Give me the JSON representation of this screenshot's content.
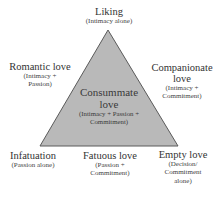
{
  "diagram": {
    "colors": {
      "triangle_fill": "#b9b9b9",
      "triangle_stroke": "#5a5a5a",
      "text": "#333333"
    },
    "apex": {
      "title": "Liking",
      "subtitle": "(Intimacy alone)"
    },
    "left_side": {
      "title": "Romantic love",
      "subtitle_line1": "(Intimacy +",
      "subtitle_line2": "Passion)"
    },
    "right_side": {
      "title_line1": "Companionate",
      "title_line2": "love",
      "subtitle_line1": "(Intimacy +",
      "subtitle_line2": "Commitment)"
    },
    "center": {
      "title_line1": "Consummate",
      "title_line2": "love",
      "subtitle_line1": "(Intimacy + Passion +",
      "subtitle_line2": "Commitment)"
    },
    "bottom_left": {
      "title": "Infatuation",
      "subtitle": "(Passion alone)"
    },
    "bottom_center": {
      "title": "Fatuous love",
      "subtitle_line1": "(Passion +",
      "subtitle_line2": "Commitment)"
    },
    "bottom_right": {
      "title": "Empty love",
      "subtitle_line1": "(Decision/",
      "subtitle_line2": "Commitment",
      "subtitle_line3": "alone)"
    }
  }
}
